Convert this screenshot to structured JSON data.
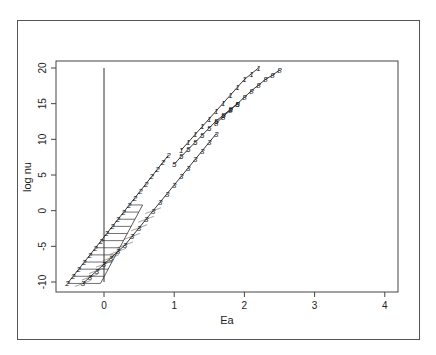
{
  "chart_data": {
    "type": "line",
    "title": "",
    "xlabel": "Ea",
    "ylabel": "log nu",
    "xlim": [
      -0.7,
      4.15
    ],
    "ylim": [
      -11.2,
      21
    ],
    "xticks": [
      0,
      1,
      2,
      3,
      4
    ],
    "yticks": [
      -10,
      -5,
      0,
      5,
      10,
      15,
      20
    ],
    "xtick_labels": [
      "0",
      "1",
      "2",
      "3",
      "4"
    ],
    "ytick_labels": [
      "-10",
      "-5",
      "0",
      "5",
      "10",
      "15",
      "20"
    ],
    "grid": false,
    "legend": "none",
    "reference_line": {
      "x": 0,
      "y_from": -10,
      "y_to": 20
    },
    "series": [
      {
        "name": "2",
        "marker": "2",
        "x": [
          -0.52,
          -0.44,
          -0.36,
          -0.28,
          -0.2,
          -0.12,
          -0.04,
          0.04,
          0.12,
          0.2,
          0.28,
          0.36,
          0.44,
          0.52,
          0.6,
          0.68,
          0.76,
          0.84,
          0.92
        ],
        "y": [
          -10.2,
          -9.2,
          -8.2,
          -7.2,
          -6.2,
          -5.2,
          -4.2,
          -3.2,
          -2.2,
          -1.2,
          -0.2,
          0.8,
          1.8,
          2.8,
          3.8,
          4.8,
          5.8,
          6.8,
          7.8
        ]
      },
      {
        "name": "3",
        "marker": "3",
        "x": [
          -0.3,
          -0.2,
          -0.1,
          0.0,
          0.1,
          0.2,
          0.3,
          0.4,
          0.5,
          0.6,
          0.7,
          0.8,
          0.9,
          1.0,
          1.1,
          1.2,
          1.3,
          1.4,
          1.5,
          1.6
        ],
        "y": [
          -10.2,
          -9.3,
          -8.4,
          -7.5,
          -6.6,
          -5.7,
          -4.8,
          -3.6,
          -2.4,
          -1.2,
          0.0,
          1.2,
          2.4,
          3.6,
          4.8,
          6.0,
          7.2,
          8.4,
          9.6,
          10.8
        ]
      },
      {
        "name": "1",
        "marker": "1",
        "x": [
          1.1,
          1.2,
          1.3,
          1.4,
          1.5,
          1.6,
          1.7,
          1.8,
          1.9,
          2.0,
          2.1,
          2.2
        ],
        "y": [
          8.5,
          9.6,
          10.7,
          11.8,
          12.9,
          14.0,
          15.1,
          16.2,
          17.3,
          18.4,
          19.2,
          20.0
        ]
      },
      {
        "name": "5",
        "marker": "5",
        "x": [
          1.0,
          1.1,
          1.2,
          1.3,
          1.4,
          1.5,
          1.6,
          1.7,
          1.8,
          1.9
        ],
        "y": [
          6.5,
          7.6,
          8.6,
          9.6,
          10.6,
          11.6,
          12.6,
          13.4,
          14.2,
          15.0
        ]
      },
      {
        "name": "8",
        "marker": "8",
        "x": [
          1.6,
          1.7,
          1.8,
          1.9,
          2.0,
          2.1,
          2.2,
          2.3,
          2.4,
          2.5
        ],
        "y": [
          12.3,
          13.2,
          14.1,
          15.0,
          15.9,
          16.8,
          17.6,
          18.4,
          19.0,
          19.7
        ]
      }
    ],
    "hatch": {
      "description": "horizontal lines from series 2 to right boundary line",
      "boundary": {
        "x": [
          -0.05,
          0.55
        ],
        "y": [
          -10.2,
          0.8
        ]
      }
    }
  }
}
